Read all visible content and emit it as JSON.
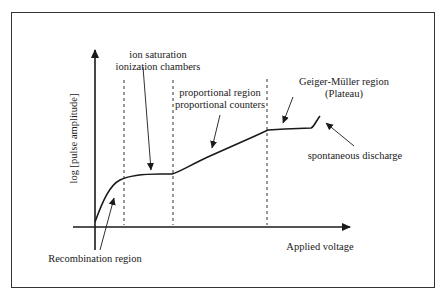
{
  "diagram": {
    "type": "gas-detector-operating-regions",
    "axes": {
      "x_label": "Applied voltage",
      "y_label": "log [pulse amplitude]"
    },
    "regions": [
      {
        "line1": "ion saturation",
        "line2": "ionization chambers"
      },
      {
        "line1": "proportional region",
        "line2": "proportional counters"
      },
      {
        "line1": "Geiger-Müller region",
        "line2": "(Plateau)"
      }
    ],
    "annotations": {
      "recombination": "Recombination region",
      "spontaneous": "spontaneous discharge"
    },
    "colors": {
      "line": "#1a1a1a",
      "border": "#333333"
    }
  }
}
